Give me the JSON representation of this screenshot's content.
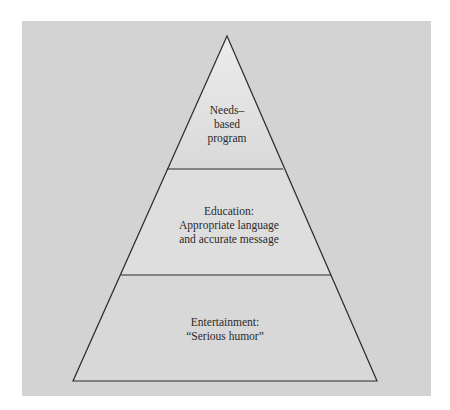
{
  "diagram": {
    "type": "pyramid",
    "colors": {
      "background_panel": "#d3d3d3",
      "pyramid_fill": "#dedede",
      "outline": "#2b2b2b"
    },
    "tiers": [
      {
        "position": "top",
        "lines": [
          "Needs–",
          "based",
          "program"
        ]
      },
      {
        "position": "middle",
        "lines": [
          "Education:",
          "Appropriate language",
          "and accurate message"
        ]
      },
      {
        "position": "bottom",
        "lines": [
          "Entertainment:",
          "“Serious humor”"
        ]
      }
    ]
  }
}
